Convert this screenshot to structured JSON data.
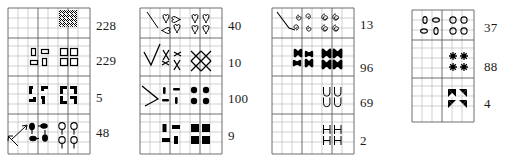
{
  "figure": {
    "type": "symbol-grid-panels",
    "panel_count": 4,
    "background_color": "#ffffff",
    "grid_line_color": "#b9b9b9",
    "grid_major_color": "#5a5a5a",
    "ink_color": "#000000"
  },
  "panels": [
    {
      "id": "panel-1",
      "x": 8,
      "y": 8,
      "w": 82,
      "h": 146,
      "cols": 8,
      "rows": 14,
      "rows_data": [
        {
          "label": "row-1",
          "count": "228",
          "count_y": 26,
          "symbol": "dither-checker",
          "symbol_desc": "dense dithered checkerboard block"
        },
        {
          "label": "row-2",
          "count": "229",
          "count_y": 61,
          "symbol": "open-rectangle",
          "symbol_desc": "small open rectangles, alternating orientation"
        },
        {
          "label": "row-3",
          "count": "5",
          "count_y": 98,
          "symbol": "filled-corner-L",
          "symbol_desc": "solid L / corner blocks"
        },
        {
          "label": "row-4",
          "count": "48",
          "count_y": 133,
          "symbol": "balloon-tack",
          "symbol_desc": "small lollipop / tack shapes, mirrored"
        }
      ]
    },
    {
      "id": "panel-2",
      "x": 140,
      "y": 8,
      "w": 82,
      "h": 146,
      "cols": 8,
      "rows": 14,
      "rows_data": [
        {
          "label": "row-1",
          "count": "40",
          "count_y": 26,
          "symbol": "heart-outline",
          "symbol_desc": "small outline hearts plus diagonal stroke"
        },
        {
          "label": "row-2",
          "count": "10",
          "count_y": 63,
          "symbol": "x-cross",
          "symbol_desc": "X / cross strokes forming lattice"
        },
        {
          "label": "row-3",
          "count": "100",
          "count_y": 99,
          "symbol": "filled-dot",
          "symbol_desc": "dashes and solid round dots"
        },
        {
          "label": "row-4",
          "count": "9",
          "count_y": 136,
          "symbol": "filled-square",
          "symbol_desc": "solid square blocks in 2x2"
        }
      ]
    },
    {
      "id": "panel-3",
      "x": 272,
      "y": 8,
      "w": 82,
      "h": 146,
      "cols": 8,
      "rows": 14,
      "rows_data": [
        {
          "label": "row-1",
          "count": "13",
          "count_y": 25,
          "symbol": "spiral-glyph",
          "symbol_desc": "small spiral / 6-like glyphs, diagonal stroke"
        },
        {
          "label": "row-2",
          "count": "96",
          "count_y": 68,
          "symbol": "bowtie-x",
          "symbol_desc": "bold bowtie / X glyphs"
        },
        {
          "label": "row-3",
          "count": "69",
          "count_y": 103,
          "symbol": "letter-U",
          "symbol_desc": "letter U outline glyphs"
        },
        {
          "label": "row-4",
          "count": "2",
          "count_y": 141,
          "symbol": "letter-H",
          "symbol_desc": "letter H outline glyphs"
        }
      ]
    },
    {
      "id": "panel-4",
      "x": 412,
      "y": 8,
      "w": 62,
      "h": 114,
      "cols": 6,
      "rows": 11,
      "rows_data": [
        {
          "label": "row-1",
          "count": "37",
          "count_y": 28,
          "symbol": "open-ellipse",
          "symbol_desc": "small open ellipses, alternating orientation"
        },
        {
          "label": "row-2",
          "count": "88",
          "count_y": 67,
          "symbol": "asterisk-star",
          "symbol_desc": "asterisk / starburst glyphs"
        },
        {
          "label": "row-3",
          "count": "4",
          "count_y": 104,
          "symbol": "filled-triangle-pair",
          "symbol_desc": "solid arrow / triangle blocks"
        }
      ]
    }
  ],
  "counts_all": [
    "228",
    "229",
    "5",
    "48",
    "40",
    "10",
    "100",
    "9",
    "13",
    "96",
    "69",
    "2",
    "37",
    "88",
    "4"
  ]
}
